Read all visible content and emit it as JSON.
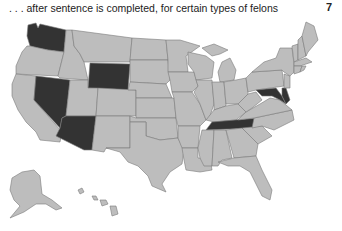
{
  "header": {
    "caption": ". . . after sentence is completed, for certain types of felons",
    "page_number": "7"
  },
  "map": {
    "title": "United States map",
    "colors": {
      "default_state": "#bdbdbd",
      "highlighted_state": "#333333",
      "border": "#7a7a7a"
    },
    "highlighted_states": [
      "Washington",
      "Wyoming",
      "Nevada",
      "Arizona",
      "Tennessee",
      "Maryland",
      "Delaware"
    ]
  }
}
